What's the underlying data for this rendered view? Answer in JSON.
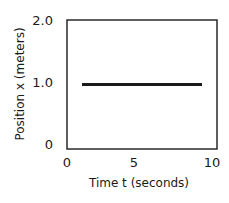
{
  "chart_data": {
    "type": "line",
    "title": "",
    "xlabel": "Time t (seconds)",
    "ylabel": "Position x (meters)",
    "xlim": [
      0,
      10
    ],
    "ylim": [
      0,
      2.0
    ],
    "x_ticks": [
      "0",
      "5",
      "10"
    ],
    "y_ticks": [
      "0",
      "1.0",
      "2.0"
    ],
    "grid": false,
    "legend": null,
    "series": [
      {
        "name": "position",
        "x": [
          1.0,
          9.0
        ],
        "y": [
          1.0,
          1.0
        ],
        "color": "#1a1a1a"
      }
    ]
  }
}
